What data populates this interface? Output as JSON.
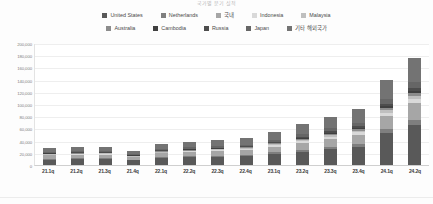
{
  "title": "국가별 분기 실적",
  "chart_data": {
    "type": "bar",
    "stacked": true,
    "title": "국가별 분기 실적",
    "xlabel": "",
    "ylabel": "",
    "ylim": [
      0,
      200000
    ],
    "ytick_labels": [
      "200,000",
      "180,000",
      "160,000",
      "140,000",
      "120,000",
      "100,000",
      "80,000",
      "60,000",
      "40,000",
      "20,000",
      "0"
    ],
    "ytick_values": [
      200000,
      180000,
      160000,
      140000,
      120000,
      100000,
      80000,
      60000,
      40000,
      20000,
      0
    ],
    "grid": true,
    "legend_position": "top",
    "categories": [
      "21.1q",
      "21.2q",
      "21.3q",
      "21.4q",
      "22.1q",
      "22.2q",
      "22.3q",
      "22.4q",
      "23.1q",
      "23.2q",
      "23.3q",
      "23.4q",
      "24.1q",
      "24.2q"
    ],
    "series": [
      {
        "name": "United States",
        "color": "#595959",
        "values": [
          9000,
          9500,
          9800,
          7500,
          11000,
          12500,
          13500,
          14500,
          18000,
          22000,
          26000,
          30000,
          52000,
          66000
        ]
      },
      {
        "name": "Netherlands",
        "color": "#7f7f7f",
        "values": [
          1200,
          1300,
          1300,
          1000,
          1500,
          1600,
          1800,
          2000,
          2600,
          3200,
          3800,
          4400,
          6500,
          8000
        ]
      },
      {
        "name": "국내",
        "color": "#a6a6a6",
        "values": [
          5500,
          5800,
          5800,
          4500,
          6500,
          7000,
          7500,
          8000,
          9500,
          11500,
          13500,
          15500,
          22000,
          27000
        ]
      },
      {
        "name": "Indonesia",
        "color": "#d9d9d9",
        "values": [
          1000,
          1100,
          1100,
          900,
          1300,
          1400,
          1500,
          1700,
          2100,
          2600,
          3100,
          3600,
          5200,
          6500
        ]
      },
      {
        "name": "Malaysia",
        "color": "#bfbfbf",
        "values": [
          900,
          950,
          950,
          750,
          1100,
          1200,
          1300,
          1400,
          1800,
          2200,
          2600,
          3000,
          4400,
          5500
        ]
      },
      {
        "name": "Australia",
        "color": "#8c8c8c",
        "values": [
          800,
          850,
          850,
          650,
          1000,
          1100,
          1150,
          1250,
          1600,
          1950,
          2300,
          2700,
          3900,
          4900
        ]
      },
      {
        "name": "Cambodia",
        "color": "#404040",
        "values": [
          700,
          750,
          750,
          600,
          900,
          950,
          1000,
          1100,
          1400,
          1700,
          2000,
          2350,
          3400,
          4300
        ]
      },
      {
        "name": "Russia",
        "color": "#4d4d4d",
        "values": [
          600,
          650,
          650,
          500,
          750,
          800,
          850,
          950,
          1200,
          1450,
          1700,
          2000,
          2900,
          3700
        ]
      },
      {
        "name": "Japan",
        "color": "#666666",
        "values": [
          1800,
          1900,
          1900,
          1500,
          2200,
          2400,
          2600,
          2800,
          3500,
          4300,
          5100,
          5900,
          8600,
          10800
        ]
      },
      {
        "name": "기타 해외국가",
        "color": "#737373",
        "values": [
          6500,
          7000,
          7200,
          5600,
          8200,
          9000,
          9700,
          10500,
          13200,
          16000,
          19000,
          22000,
          31000,
          39000
        ]
      }
    ],
    "totals": [
      28000,
      29800,
      30300,
      23500,
      34450,
      37950,
      40900,
      44200,
      54900,
      66900,
      79100,
      91450,
      139900,
      175700
    ]
  },
  "legend": {
    "rows": [
      [
        {
          "label": "United States",
          "color": "#595959"
        },
        {
          "label": "Netherlands",
          "color": "#7f7f7f"
        },
        {
          "label": "국내",
          "color": "#a6a6a6"
        },
        {
          "label": "Indonesia",
          "color": "#d9d9d9"
        },
        {
          "label": "Malaysia",
          "color": "#bfbfbf"
        }
      ],
      [
        {
          "label": "Australia",
          "color": "#8c8c8c"
        },
        {
          "label": "Cambodia",
          "color": "#404040"
        },
        {
          "label": "Russia",
          "color": "#4d4d4d"
        },
        {
          "label": "Japan",
          "color": "#666666"
        },
        {
          "label": "기타 해외국가",
          "color": "#737373"
        }
      ]
    ]
  }
}
